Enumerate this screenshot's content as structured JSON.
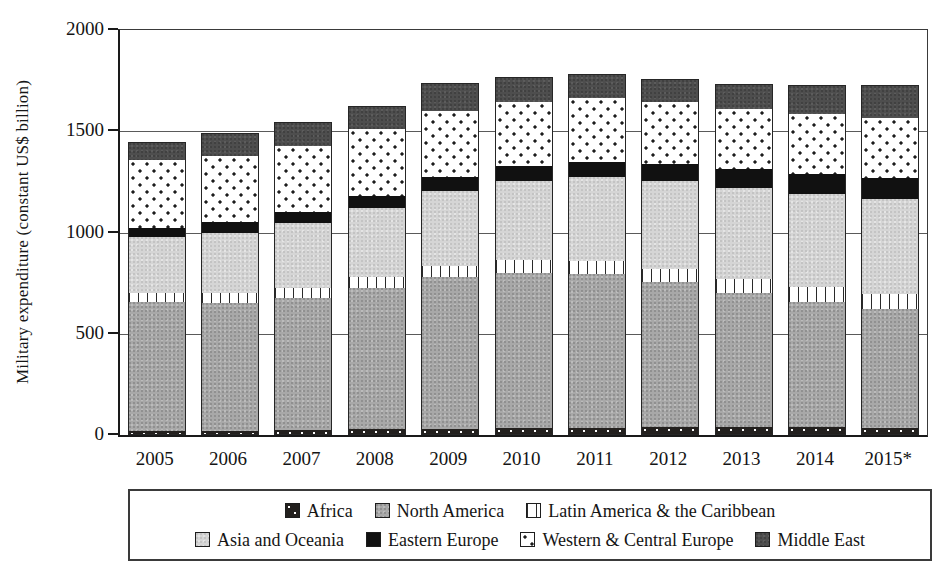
{
  "chart_data": {
    "type": "bar",
    "subtype": "stacked-bar",
    "title": "",
    "xlabel": "",
    "ylabel": "Military expenditure (constant US$ billion)",
    "ylim": [
      0,
      2000
    ],
    "yticks": [
      0,
      500,
      1000,
      1500,
      2000
    ],
    "ytick_labels": [
      "0",
      "500",
      "1000",
      "1500",
      "2000"
    ],
    "grid": true,
    "grid_axis": "y",
    "legend_position": "bottom",
    "categories": [
      "2005",
      "2006",
      "2007",
      "2008",
      "2009",
      "2010",
      "2011",
      "2012",
      "2013",
      "2014",
      "2015*"
    ],
    "series": [
      {
        "name": "Africa",
        "key": "africa",
        "pattern": "dark-with-white-dots",
        "color": "#23201e",
        "values": [
          20,
          22,
          24,
          28,
          30,
          33,
          36,
          40,
          42,
          41,
          37
        ]
      },
      {
        "name": "North America",
        "key": "north-america",
        "pattern": "medium-gray-stipple",
        "color": "#a8a8a8",
        "values": [
          636,
          630,
          653,
          697,
          748,
          768,
          760,
          716,
          660,
          618,
          587
        ]
      },
      {
        "name": "Latin America & the Caribbean",
        "key": "latin-america-caribbean",
        "pattern": "white-with-vertical-bars",
        "color": "#ffffff",
        "values": [
          46,
          48,
          50,
          55,
          58,
          62,
          64,
          66,
          68,
          70,
          72
        ]
      },
      {
        "name": "Asia and Oceania",
        "key": "asia-oceania",
        "pattern": "light-gray-stipple",
        "color": "#d5d5d5",
        "values": [
          277,
          300,
          320,
          340,
          370,
          392,
          412,
          430,
          450,
          462,
          470
        ]
      },
      {
        "name": "Eastern Europe",
        "key": "eastern-europe",
        "pattern": "solid-black",
        "color": "#111111",
        "values": [
          45,
          50,
          55,
          62,
          68,
          72,
          78,
          88,
          94,
          100,
          104
        ]
      },
      {
        "name": "Western & Central Europe",
        "key": "western-central-europe",
        "pattern": "white-with-black-dots",
        "color": "#ffffff",
        "values": [
          336,
          330,
          327,
          330,
          324,
          318,
          312,
          304,
          298,
          294,
          296
        ]
      },
      {
        "name": "Middle East",
        "key": "middle-east",
        "pattern": "dark-gray-stipple",
        "color": "#4e4e4e",
        "values": [
          88,
          110,
          118,
          112,
          142,
          122,
          120,
          114,
          120,
          142,
          164
        ]
      }
    ],
    "totals": [
      1448,
      1490,
      1547,
      1624,
      1740,
      1767,
      1782,
      1758,
      1732,
      1727,
      1730
    ],
    "note_marker": "*",
    "note_meaning": "2015 figures are estimates"
  },
  "legend": {
    "row1": [
      "Africa",
      "North America",
      "Latin America & the Caribbean"
    ],
    "row2": [
      "Asia and Oceania",
      "Eastern Europe",
      "Western & Central Europe",
      "Middle East"
    ]
  },
  "footnote": {
    "text": ""
  }
}
